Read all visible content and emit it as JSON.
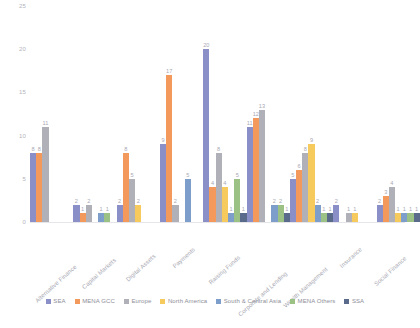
{
  "chart_data": {
    "type": "bar",
    "title": "",
    "subtitle": "",
    "xlabel": "",
    "ylabel": "",
    "ylim": [
      0,
      25
    ],
    "yticks": [
      0,
      5,
      10,
      15,
      20,
      25
    ],
    "grid": false,
    "legend_position": "bottom",
    "categories": [
      "Alternative Finance",
      "Capital Markets",
      "Digital Assets",
      "Payments",
      "Raising Funds",
      "Corporate and Lending",
      "Wealth Management",
      "Insurance",
      "Social Finance"
    ],
    "series": [
      {
        "name": "SEA",
        "color": "#8b8fc7",
        "values": [
          8,
          2,
          2,
          9,
          20,
          11,
          5,
          2,
          2
        ]
      },
      {
        "name": "MENA GCC",
        "color": "#f4995c",
        "values": [
          8,
          1,
          8,
          17,
          4,
          12,
          6,
          0,
          3
        ]
      },
      {
        "name": "Europe",
        "color": "#b0b0b8",
        "values": [
          11,
          2,
          5,
          2,
          8,
          13,
          8,
          1,
          4
        ]
      },
      {
        "name": "North America",
        "color": "#f7ca5e",
        "values": [
          0,
          0,
          2,
          0,
          4,
          0,
          9,
          1,
          1
        ]
      },
      {
        "name": "South & Central Asia",
        "color": "#7d9ecb",
        "values": [
          0,
          1,
          0,
          5,
          1,
          2,
          2,
          0,
          1
        ]
      },
      {
        "name": "MENA Others",
        "color": "#9cc184",
        "values": [
          0,
          1,
          0,
          0,
          5,
          2,
          1,
          0,
          1
        ]
      },
      {
        "name": "SSA",
        "color": "#5a6a8a",
        "values": [
          0,
          0,
          0,
          0,
          1,
          1,
          1,
          0,
          1
        ]
      }
    ]
  }
}
